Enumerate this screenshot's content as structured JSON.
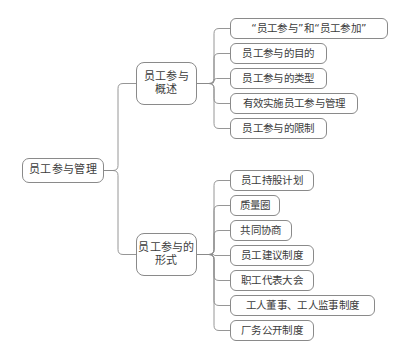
{
  "diagram": {
    "type": "mind-map",
    "title": "员工参与管理",
    "stroke_color": "#8a8a8a",
    "text_color": "#3c3c3c",
    "background_color": "#ffffff"
  },
  "root": {
    "label": "员工参与管理",
    "x": 22,
    "y": 158,
    "w": 82,
    "h": 25
  },
  "branches": [
    {
      "id": "overview",
      "label": "员工参与\n概述",
      "x": 136,
      "y": 62,
      "w": 61,
      "h": 43,
      "children": [
        {
          "label": "“员工参与”和“员工参加”",
          "x": 230,
          "y": 18,
          "w": 158,
          "h": 21
        },
        {
          "label": "员工参与的目的",
          "x": 230,
          "y": 43,
          "w": 97,
          "h": 21
        },
        {
          "label": "员工参与的类型",
          "x": 230,
          "y": 68,
          "w": 97,
          "h": 21
        },
        {
          "label": "有效实施员工参与管理",
          "x": 230,
          "y": 93,
          "w": 128,
          "h": 21
        },
        {
          "label": "员工参与的限制",
          "x": 230,
          "y": 118,
          "w": 97,
          "h": 21
        }
      ]
    },
    {
      "id": "forms",
      "label": "员工参与的\n形式",
      "x": 136,
      "y": 233,
      "w": 61,
      "h": 43,
      "children": [
        {
          "label": "员工持股计划",
          "x": 230,
          "y": 170,
          "w": 84,
          "h": 21
        },
        {
          "label": "质量圈",
          "x": 230,
          "y": 195,
          "w": 50,
          "h": 21
        },
        {
          "label": "共同协商",
          "x": 230,
          "y": 220,
          "w": 62,
          "h": 21
        },
        {
          "label": "员工建议制度",
          "x": 230,
          "y": 245,
          "w": 84,
          "h": 21
        },
        {
          "label": "职工代表大会",
          "x": 230,
          "y": 270,
          "w": 84,
          "h": 21
        },
        {
          "label": "工人董事、工人监事制度",
          "x": 230,
          "y": 295,
          "w": 145,
          "h": 21
        },
        {
          "label": "厂务公开制度",
          "x": 230,
          "y": 320,
          "w": 84,
          "h": 21
        }
      ]
    }
  ],
  "connectors": {
    "root_trunk_x": 118,
    "branch_trunk_x": 214,
    "corner_radius": 5
  }
}
